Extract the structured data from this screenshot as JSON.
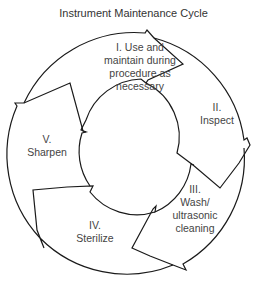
{
  "diagram": {
    "title": "Instrument Maintenance Cycle",
    "type": "cycle",
    "steps": [
      {
        "numeral": "I.",
        "text": "Use and maintain during procedure as necessary",
        "line1": "I. Use and",
        "line2": "maintain during",
        "line3": "procedure as",
        "line4": "necessary"
      },
      {
        "numeral": "II.",
        "text": "Inspect",
        "line1": "II.",
        "line2": "Inspect"
      },
      {
        "numeral": "III.",
        "text": "Wash/ ultrasonic cleaning",
        "line1": "III.",
        "line2": "Wash/",
        "line3": "ultrasonic",
        "line4": "cleaning"
      },
      {
        "numeral": "IV.",
        "text": "Sterilize",
        "line1": "IV.",
        "line2": "Sterilize"
      },
      {
        "numeral": "V.",
        "text": "Sharpen",
        "line1": "V.",
        "line2": "Sharpen"
      }
    ],
    "colors": {
      "stroke": "#1a1a1a",
      "text": "#444444",
      "background": "#ffffff"
    }
  }
}
